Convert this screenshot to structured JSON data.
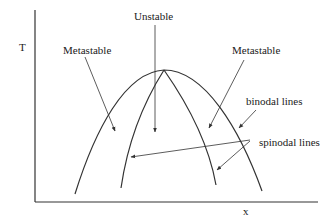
{
  "diagram": {
    "type": "phase-diagram",
    "axes": {
      "y_label": "T",
      "x_label": "x"
    },
    "regions": {
      "center": "Unstable",
      "left": "Metastable",
      "right": "Metastable"
    },
    "annotations": {
      "binodal": "binodal lines",
      "spinodal": "spinodal lines"
    },
    "colors": {
      "line": "#333333",
      "text": "#1a1a1a",
      "background": "#ffffff"
    }
  }
}
